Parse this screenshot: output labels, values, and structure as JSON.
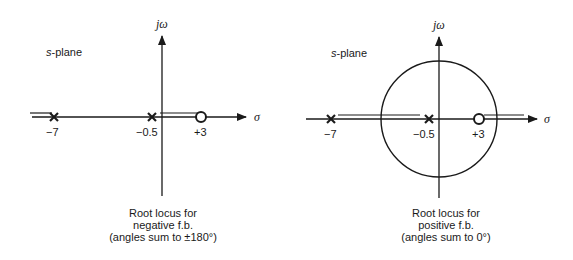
{
  "panels": [
    {
      "id": "negative",
      "plane_label": "s-plane",
      "plane_label_italic": "s",
      "plane_label_rest": "-plane",
      "y_axis_label": "jω",
      "x_axis_label": "σ",
      "poles": [
        {
          "value": -7,
          "label": "−7"
        },
        {
          "value": -0.5,
          "label": "−0.5"
        }
      ],
      "zeros": [
        {
          "value": 3,
          "label": "+3"
        }
      ],
      "locus_segments": "real axis left of −7 and between −0.5 and +3",
      "caption": [
        "Root locus for",
        "negative f.b.",
        "(angles sum to ±180°)"
      ]
    },
    {
      "id": "positive",
      "plane_label": "s-plane",
      "plane_label_italic": "s",
      "plane_label_rest": "-plane",
      "y_axis_label": "jω",
      "x_axis_label": "σ",
      "poles": [
        {
          "value": -7,
          "label": "−7"
        },
        {
          "value": -0.5,
          "label": "−0.5"
        }
      ],
      "zeros": [
        {
          "value": 3,
          "label": "+3"
        }
      ],
      "locus_segments": "real axis between −7 and −0.5, right of +3, plus circular locus",
      "caption": [
        "Root locus for",
        "positive f.b.",
        "(angles sum to 0°)"
      ]
    }
  ]
}
